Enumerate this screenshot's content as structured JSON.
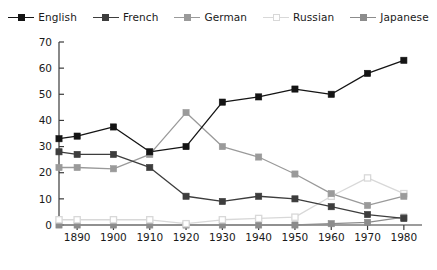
{
  "legend": {
    "items": [
      {
        "label": "English",
        "color": "#141414",
        "marker": "filled",
        "icon": "legend-line-marker-icon"
      },
      {
        "label": "French",
        "color": "#3d3d3d",
        "marker": "filled",
        "icon": "legend-line-marker-icon"
      },
      {
        "label": "German",
        "color": "#9a9a9a",
        "marker": "filled",
        "icon": "legend-line-marker-icon"
      },
      {
        "label": "Russian",
        "color": "#d8d8d8",
        "marker": "hollow",
        "icon": "legend-line-marker-icon"
      },
      {
        "label": "Japanese",
        "color": "#8c8c8c",
        "marker": "filled",
        "icon": "legend-line-marker-icon"
      }
    ]
  },
  "chart_data": {
    "type": "line",
    "title": "",
    "subtitle": "",
    "xlabel": "",
    "ylabel": "",
    "xlim": [
      1885,
      1985
    ],
    "ylim": [
      0,
      70
    ],
    "grid": false,
    "legend_position": "top",
    "x": [
      1885,
      1890,
      1900,
      1910,
      1920,
      1930,
      1940,
      1950,
      1960,
      1970,
      1980
    ],
    "xticks": [
      1890,
      1900,
      1910,
      1920,
      1930,
      1940,
      1950,
      1960,
      1970,
      1980
    ],
    "xticklabels": [
      "1890",
      "1900",
      "1910",
      "1920",
      "1930",
      "1940",
      "1950",
      "1960",
      "1970",
      "1980"
    ],
    "yticks": [
      0,
      10,
      20,
      30,
      40,
      50,
      60,
      70
    ],
    "yticklabels": [
      "0",
      "10",
      "20",
      "30",
      "40",
      "50",
      "60",
      "70"
    ],
    "series": [
      {
        "name": "English",
        "color": "#141414",
        "marker": "filled",
        "values": [
          33,
          34,
          37.5,
          28,
          30,
          47,
          49,
          52,
          50,
          58,
          63
        ]
      },
      {
        "name": "French",
        "color": "#3d3d3d",
        "marker": "filled",
        "values": [
          28,
          27,
          27,
          22,
          11,
          9,
          11,
          10,
          7,
          4,
          2.5
        ]
      },
      {
        "name": "German",
        "color": "#9a9a9a",
        "marker": "filled",
        "values": [
          22,
          22,
          21.5,
          27,
          43,
          30,
          26,
          19.5,
          12,
          7.5,
          11
        ]
      },
      {
        "name": "Russian",
        "color": "#d8d8d8",
        "marker": "hollow",
        "values": [
          2,
          2,
          2,
          2,
          0.5,
          2,
          2.5,
          3,
          11,
          18,
          12
        ]
      },
      {
        "name": "Japanese",
        "color": "#8c8c8c",
        "marker": "filled",
        "values": [
          0,
          0,
          0,
          0,
          0,
          0,
          0,
          0,
          0.5,
          1,
          3
        ]
      }
    ]
  }
}
